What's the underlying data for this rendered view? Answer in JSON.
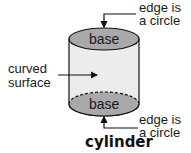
{
  "diagram": {
    "title": "cylinder",
    "top_base_label": "base",
    "bottom_base_label": "base",
    "curved_surface_label": [
      "curved",
      "surface"
    ],
    "top_edge_label": [
      "edge is",
      "a circle"
    ],
    "bottom_edge_label": [
      "edge is",
      "a circle"
    ]
  },
  "colors": {
    "base_fill": "#a9a9a9",
    "surface_fill": "#ececec",
    "stroke": "#111111"
  }
}
